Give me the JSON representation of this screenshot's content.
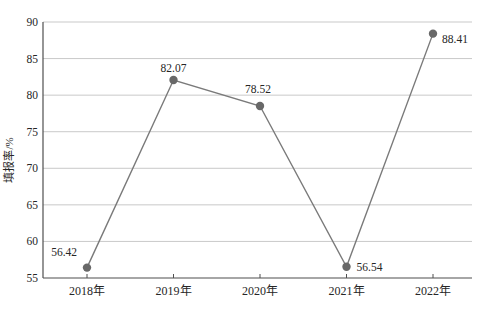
{
  "chart_data": {
    "type": "line",
    "title": "",
    "xlabel": "",
    "ylabel": "填报率/%",
    "categories": [
      "2018年",
      "2019年",
      "2020年",
      "2021年",
      "2022年"
    ],
    "series": [
      {
        "name": "填报率",
        "values": [
          56.42,
          82.07,
          78.52,
          56.54,
          88.41
        ]
      }
    ],
    "point_labels": [
      "56.42",
      "82.07",
      "78.52",
      "56.54",
      "88.41"
    ],
    "ylim": [
      55,
      90
    ],
    "yticks": [
      55,
      60,
      65,
      70,
      75,
      80,
      85,
      90
    ],
    "grid": "horizontal-only",
    "legend": "none",
    "marker": "circle",
    "colors": {
      "line": "#7a7a7a",
      "marker": "#686868",
      "grid": "#c9c9c9",
      "axis": "#4f4f4f",
      "text": "#262626",
      "background": "#ffffff"
    },
    "point_label_layout": [
      {
        "anchor": "end",
        "dx": -10,
        "dy": -12
      },
      {
        "anchor": "middle",
        "dx": 0,
        "dy": -8
      },
      {
        "anchor": "middle",
        "dx": -2,
        "dy": -13
      },
      {
        "anchor": "start",
        "dx": 10,
        "dy": 4
      },
      {
        "anchor": "start",
        "dx": 9,
        "dy": 9
      }
    ]
  }
}
